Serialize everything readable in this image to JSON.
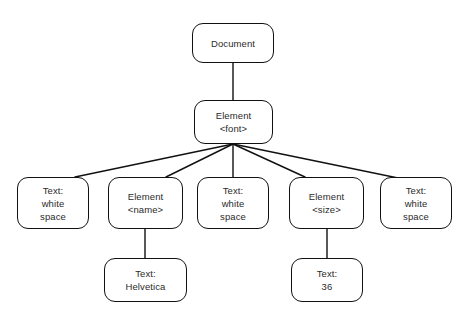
{
  "diagram": {
    "type": "tree",
    "background_color": "#ffffff",
    "node_stroke_color": "#111111",
    "node_fill_color": "#ffffff",
    "text_color": "#2b2b2b",
    "edge_color": "#111111",
    "nodes": [
      {
        "id": "document",
        "lines": [
          "Document"
        ],
        "x": 192,
        "y": 23,
        "w": 82,
        "h": 40
      },
      {
        "id": "element-font",
        "lines": [
          "Element",
          "<font>"
        ],
        "x": 194,
        "y": 100,
        "w": 79,
        "h": 44
      },
      {
        "id": "text-ws-1",
        "lines": [
          "Text:",
          "white",
          "space"
        ],
        "x": 17,
        "y": 177,
        "w": 72,
        "h": 52
      },
      {
        "id": "element-name",
        "lines": [
          "Element",
          "<name>"
        ],
        "x": 108,
        "y": 177,
        "w": 75,
        "h": 52
      },
      {
        "id": "text-ws-2",
        "lines": [
          "Text:",
          "white",
          "space"
        ],
        "x": 197,
        "y": 177,
        "w": 72,
        "h": 52
      },
      {
        "id": "element-size",
        "lines": [
          "Element",
          "<size>"
        ],
        "x": 289,
        "y": 177,
        "w": 75,
        "h": 52
      },
      {
        "id": "text-ws-3",
        "lines": [
          "Text:",
          "white",
          "space"
        ],
        "x": 380,
        "y": 177,
        "w": 72,
        "h": 52
      },
      {
        "id": "text-helvetica",
        "lines": [
          "Text:",
          "Helvetica"
        ],
        "x": 104,
        "y": 258,
        "w": 83,
        "h": 44
      },
      {
        "id": "text-36",
        "lines": [
          "Text:",
          "36"
        ],
        "x": 291,
        "y": 258,
        "w": 72,
        "h": 44
      }
    ],
    "edges": [
      {
        "id": "document-to-element-font",
        "from": "document",
        "to": "element-font",
        "x1": 233,
        "y1": 63,
        "x2": 233,
        "y2": 100
      },
      {
        "id": "element-font-to-text-ws-1",
        "from": "element-font",
        "to": "text-ws-1",
        "x1": 233,
        "y1": 144,
        "x2": 75,
        "y2": 177
      },
      {
        "id": "element-font-to-element-name",
        "from": "element-font",
        "to": "element-name",
        "x1": 233,
        "y1": 144,
        "x2": 166,
        "y2": 177
      },
      {
        "id": "element-font-to-text-ws-2",
        "from": "element-font",
        "to": "text-ws-2",
        "x1": 233,
        "y1": 144,
        "x2": 233,
        "y2": 177
      },
      {
        "id": "element-font-to-element-size",
        "from": "element-font",
        "to": "element-size",
        "x1": 233,
        "y1": 144,
        "x2": 305,
        "y2": 177
      },
      {
        "id": "element-font-to-text-ws-3",
        "from": "element-font",
        "to": "text-ws-3",
        "x1": 233,
        "y1": 144,
        "x2": 398,
        "y2": 178
      },
      {
        "id": "element-name-to-text-helvetica",
        "from": "element-name",
        "to": "text-helvetica",
        "x1": 145,
        "y1": 229,
        "x2": 145,
        "y2": 258
      },
      {
        "id": "element-size-to-text-36",
        "from": "element-size",
        "to": "text-36",
        "x1": 327,
        "y1": 229,
        "x2": 327,
        "y2": 258
      }
    ]
  }
}
